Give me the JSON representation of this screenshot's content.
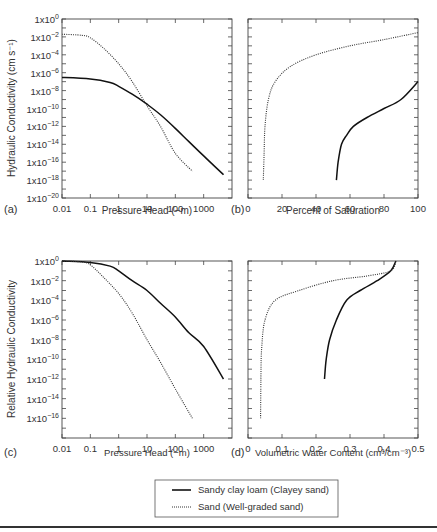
{
  "figure": {
    "legend": {
      "entries": [
        {
          "label": "Sandy clay loam (Clayey sand)",
          "style": "solid"
        },
        {
          "label": "Sand (Well-graded sand)",
          "style": "dotted"
        }
      ]
    }
  },
  "chart_data": [
    {
      "panel": "(a)",
      "type": "line",
      "xlabel": "Pressure Head (−m)",
      "ylabel": "Hydraulic Conductivity (cm s⁻¹)",
      "xscale": "log",
      "yscale": "log",
      "xlim": [
        0.01,
        10000
      ],
      "ylim": [
        1e-20,
        1
      ],
      "xticks": [
        "0.01",
        "0.1",
        "1",
        "10",
        "100",
        "1000"
      ],
      "yticks": [
        "1x10^0",
        "1x10^-2",
        "1x10^-4",
        "1x10^-6",
        "1x10^-8",
        "1x10^-10",
        "1x10^-12",
        "1x10^-14",
        "1x10^-16",
        "1x10^-18",
        "1x10^-20"
      ],
      "series": [
        {
          "name": "Sandy clay loam (Clayey sand)",
          "style": "solid",
          "x": [
            0.01,
            0.1,
            0.5,
            1,
            3,
            10,
            30,
            100,
            300,
            1000,
            5000
          ],
          "y": [
            3e-07,
            2e-07,
            8e-08,
            3e-08,
            4e-09,
            3e-10,
            2e-11,
            6e-13,
            2e-14,
            5e-16,
            4e-18
          ]
        },
        {
          "name": "Sand (Well-graded sand)",
          "style": "dotted",
          "x": [
            0.01,
            0.05,
            0.1,
            0.3,
            1,
            3,
            10,
            30,
            100,
            400
          ],
          "y": [
            0.02,
            0.015,
            0.008,
            0.0005,
            1e-05,
            1e-07,
            2e-10,
            1e-12,
            1e-15,
            1e-17
          ]
        }
      ]
    },
    {
      "panel": "(b)",
      "type": "line",
      "xlabel": "Percent of Saturation",
      "ylabel": "",
      "yscale": "log",
      "xlim": [
        0,
        100
      ],
      "ylim": [
        1e-20,
        1
      ],
      "xticks": [
        "0",
        "20",
        "40",
        "60",
        "80",
        "100"
      ],
      "series": [
        {
          "name": "Sandy clay loam (Clayey sand)",
          "style": "solid",
          "x": [
            52,
            53,
            55,
            58,
            62,
            70,
            80,
            90,
            100
          ],
          "y": [
            1e-18,
            1e-16,
            1e-14,
            1e-13,
            1e-12,
            1e-11,
            1e-10,
            1e-09,
            1e-07
          ]
        },
        {
          "name": "Sand (Well-graded sand)",
          "style": "dotted",
          "x": [
            9,
            9.5,
            10,
            12,
            16,
            25,
            40,
            60,
            80,
            100
          ],
          "y": [
            1e-18,
            1e-15,
            1e-12,
            1e-09,
            1e-07,
            5e-06,
            0.0001,
            0.001,
            0.005,
            0.03
          ]
        }
      ]
    },
    {
      "panel": "(c)",
      "type": "line",
      "xlabel": "Pressure Head (−m)",
      "ylabel": "Relative Hydraulic Conductivity",
      "xscale": "log",
      "yscale": "log",
      "xlim": [
        0.01,
        10000
      ],
      "ylim": [
        1e-18,
        1
      ],
      "xticks": [
        "0.01",
        "0.1",
        "1",
        "10",
        "100",
        "1000"
      ],
      "yticks": [
        "1x10^0",
        "1x10^-2",
        "1x10^-4",
        "1x10^-6",
        "1x10^-8",
        "1x10^-10",
        "1x10^-12",
        "1x10^-14",
        "1x10^-16"
      ],
      "series": [
        {
          "name": "Sandy clay loam (Clayey sand)",
          "style": "solid",
          "x": [
            0.01,
            0.1,
            0.5,
            1,
            3,
            10,
            30,
            100,
            300,
            1000,
            5000
          ],
          "y": [
            1,
            0.7,
            0.3,
            0.1,
            0.01,
            0.001,
            5e-05,
            2e-06,
            5e-08,
            2e-09,
            1e-12
          ]
        },
        {
          "name": "Sand (Well-graded sand)",
          "style": "dotted",
          "x": [
            0.01,
            0.05,
            0.1,
            0.3,
            1,
            3,
            10,
            30,
            100,
            400
          ],
          "y": [
            1,
            0.8,
            0.4,
            0.02,
            0.0005,
            5e-06,
            1e-08,
            5e-11,
            1e-13,
            1e-16
          ]
        }
      ]
    },
    {
      "panel": "(d)",
      "type": "line",
      "xlabel": "Volumetric Water Content (cm³/cm⁻³)",
      "ylabel": "",
      "yscale": "log",
      "xlim": [
        0,
        0.5
      ],
      "ylim": [
        1e-18,
        1
      ],
      "xticks": [
        "0",
        "0.1",
        "0.2",
        "0.3",
        "0.4",
        "0.5"
      ],
      "series": [
        {
          "name": "Sandy clay loam (Clayey sand)",
          "style": "solid",
          "x": [
            0.225,
            0.23,
            0.24,
            0.26,
            0.29,
            0.33,
            0.38,
            0.42,
            0.435
          ],
          "y": [
            1e-12,
            1e-10,
            1e-08,
            1e-06,
            0.0001,
            0.001,
            0.01,
            0.1,
            1
          ]
        },
        {
          "name": "Sand (Well-graded sand)",
          "style": "dotted",
          "x": [
            0.037,
            0.038,
            0.04,
            0.05,
            0.08,
            0.15,
            0.25,
            0.35,
            0.42,
            0.435
          ],
          "y": [
            1e-16,
            1e-12,
            1e-09,
            1e-06,
            0.0001,
            0.001,
            0.01,
            0.03,
            0.1,
            1
          ]
        }
      ]
    }
  ],
  "panels": {
    "a": {
      "tag": "(a)",
      "xlabel": "Pressure Head (−m)",
      "ylabel": "Hydraulic Conductivity (cm s⁻¹)"
    },
    "b": {
      "tag": "(b)",
      "xlabel": "Percent of Saturation"
    },
    "c": {
      "tag": "(c)",
      "xlabel": "Pressure Head (−m)",
      "ylabel": "Relative Hydraulic Conductivity"
    },
    "d": {
      "tag": "(d)",
      "xlabel": "Volumetric Water Content (cm³/cm⁻³)"
    }
  }
}
